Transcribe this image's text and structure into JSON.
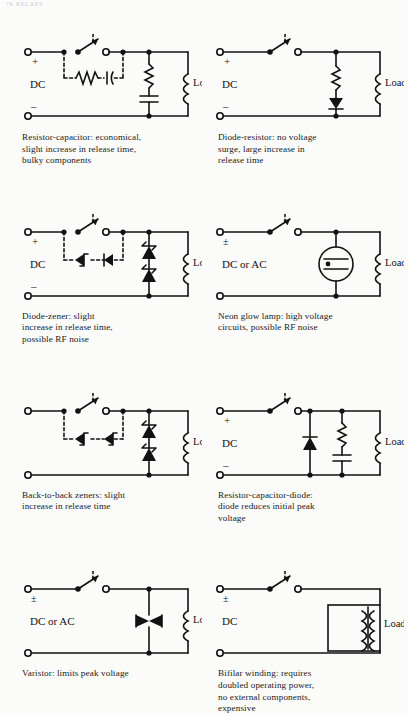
{
  "page": {
    "running_head": "76  RELAYS",
    "figure_kind": "relay contact arc-suppression circuit diagrams",
    "label_load": "Load",
    "label_dc": "DC",
    "label_dc_or_ac": "DC or AC",
    "label_plus": "+",
    "label_minus": "–",
    "label_plusminus": "±",
    "ink_color": "#121212",
    "paper_color": "#fbfbfa"
  },
  "circuits": [
    {
      "id": "resistor-capacitor",
      "position": "row1-left",
      "supply_label": "DC",
      "polarity_top": "+",
      "polarity_bottom": "–",
      "load_label": "Load",
      "suppression_elements": [
        "resistor",
        "capacitor"
      ],
      "dashed_bypass_elements": [
        "resistor",
        "capacitor"
      ],
      "caption": "Resistor-capacitor: economical,\nslight increase in release time,\nbulky components"
    },
    {
      "id": "diode-resistor",
      "position": "row1-right",
      "supply_label": "DC",
      "polarity_top": "+",
      "polarity_bottom": "–",
      "load_label": "Load",
      "suppression_elements": [
        "resistor",
        "diode"
      ],
      "dashed_bypass_elements": [],
      "caption": "Diode-resistor: no voltage\nsurge, large increase in\nrelease time"
    },
    {
      "id": "diode-zener",
      "position": "row2-left",
      "supply_label": "DC",
      "polarity_top": "+",
      "polarity_bottom": "–",
      "load_label": "Load",
      "suppression_elements": [
        "zener-diode",
        "diode"
      ],
      "dashed_bypass_elements": [
        "zener-diode",
        "diode"
      ],
      "caption": "Diode-zener: slight\nincrease in release time,\npossible RF noise"
    },
    {
      "id": "neon-glow-lamp",
      "position": "row2-right",
      "supply_label": "DC or AC",
      "polarity_top": "±",
      "polarity_bottom": "",
      "load_label": "Load",
      "suppression_elements": [
        "neon-glow-lamp"
      ],
      "dashed_bypass_elements": [],
      "caption": "Neon glow lamp: high voltage\ncircuits, possible RF noise"
    },
    {
      "id": "back-to-back-zeners",
      "position": "row3-left",
      "supply_label": "",
      "polarity_top": "",
      "polarity_bottom": "",
      "load_label": "Load",
      "suppression_elements": [
        "zener-diode",
        "zener-diode"
      ],
      "dashed_bypass_elements": [
        "zener-diode",
        "zener-diode"
      ],
      "caption": "Back-to-back zeners: slight\nincrease in release time"
    },
    {
      "id": "resistor-capacitor-diode",
      "position": "row3-right",
      "supply_label": "DC",
      "polarity_top": "+",
      "polarity_bottom": "–",
      "load_label": "Load",
      "suppression_elements": [
        "diode",
        "resistor",
        "capacitor"
      ],
      "dashed_bypass_elements": [],
      "caption": "Resistor-capacitor-diode:\ndiode reduces initial peak\nvoltage"
    },
    {
      "id": "varistor",
      "position": "row4-left",
      "supply_label": "DC or AC",
      "polarity_top": "±",
      "polarity_bottom": "",
      "load_label": "Load",
      "suppression_elements": [
        "varistor"
      ],
      "dashed_bypass_elements": [],
      "caption": "Varistor: limits peak voltage"
    },
    {
      "id": "bifilar-winding",
      "position": "row4-right",
      "supply_label": "DC",
      "polarity_top": "±",
      "polarity_bottom": "",
      "load_label": "Load",
      "suppression_elements": [
        "bifilar-transformer-winding"
      ],
      "dashed_bypass_elements": [],
      "caption": "Bifilar winding: requires\ndoubled operating power,\nno external components,\nexpensive"
    }
  ]
}
